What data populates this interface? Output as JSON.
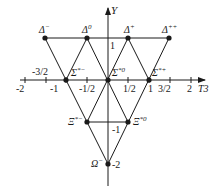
{
  "diagram": {
    "axes": {
      "x_label": "T3",
      "y_label": "Y",
      "x_ticks": [
        "-2",
        "-3/2",
        "-1",
        "-1/2",
        "1/2",
        "1",
        "3/2",
        "2"
      ],
      "y_ticks": [
        "1",
        "-1",
        "-2"
      ]
    },
    "particles": [
      {
        "name": "Δ",
        "charge": "−",
        "T3": -1.5,
        "Y": 1
      },
      {
        "name": "Δ",
        "charge": "0",
        "T3": -0.5,
        "Y": 1
      },
      {
        "name": "Δ",
        "charge": "+",
        "T3": 0.5,
        "Y": 1
      },
      {
        "name": "Δ",
        "charge": "++",
        "T3": 1.5,
        "Y": 1
      },
      {
        "name": "Σ",
        "charge": "*−",
        "T3": -1,
        "Y": 0
      },
      {
        "name": "Σ",
        "charge": "*0",
        "T3": 0,
        "Y": 0
      },
      {
        "name": "Σ",
        "charge": "*+",
        "T3": 1,
        "Y": 0
      },
      {
        "name": "Ξ",
        "charge": "*−",
        "T3": -0.5,
        "Y": -1
      },
      {
        "name": "Ξ",
        "charge": "*0",
        "T3": 0.5,
        "Y": -1
      },
      {
        "name": "Ω",
        "charge": "−",
        "T3": 0,
        "Y": -2
      }
    ],
    "colors": {
      "ink": "#1a1a1a",
      "background": "#ffffff"
    }
  }
}
